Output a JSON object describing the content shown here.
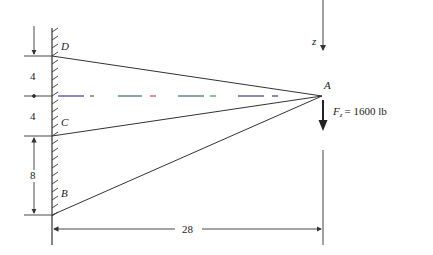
{
  "diagram": {
    "points": {
      "A": "A",
      "B": "B",
      "C": "C",
      "D": "D"
    },
    "axis_label": "z",
    "force": {
      "symbol": "F",
      "subscript": "z",
      "value_text": "= 1600 lb"
    },
    "dimensions": {
      "upper": "4",
      "middle": "4",
      "lower": "8",
      "horizontal": "28"
    },
    "colors": {
      "line": "#333333",
      "centerline_blue": "#3a3aa0",
      "centerline_red": "#d04040",
      "centerline_green": "#40a040"
    }
  }
}
